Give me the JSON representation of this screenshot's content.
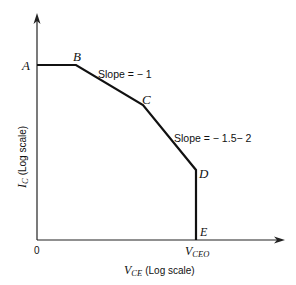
{
  "diagram": {
    "type": "piecewise-linear log-log characteristic",
    "x_axis": {
      "label_main": "V",
      "label_sub": "CE",
      "label_suffix": "(Log scale)",
      "origin_label": "0",
      "tick_label_main": "V",
      "tick_label_sub": "CEO"
    },
    "y_axis": {
      "label_main": "I",
      "label_sub": "C",
      "label_suffix": "(Log scale)"
    },
    "points": [
      {
        "label": "A",
        "x": 37,
        "y": 65
      },
      {
        "label": "B",
        "x": 76,
        "y": 65
      },
      {
        "label": "C",
        "x": 143,
        "y": 105
      },
      {
        "label": "D",
        "x": 196,
        "y": 170
      },
      {
        "label": "E",
        "x": 196,
        "y": 240
      }
    ],
    "annotations": {
      "slope_bc": "Slope = − 1",
      "slope_cd": "Slope = − 1.5− 2"
    },
    "colors": {
      "line": "#111111",
      "axis": "#222222",
      "text": "#111111"
    }
  }
}
